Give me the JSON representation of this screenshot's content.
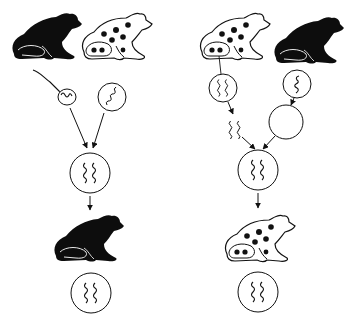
{
  "diagram": {
    "title": "Nuclear transplantation in frogs (reciprocal experiment)",
    "colors": {
      "ink": "#111111",
      "background": "#ffffff",
      "black_frog_fill": "#0d0d0d",
      "spotted_frog_fill": "#ffffff"
    },
    "panels": [
      {
        "id": "left",
        "donor_frogs": [
          "black-frog",
          "spotted-frog"
        ],
        "inputs": [
          "sperm-nucleus",
          "egg-nucleus"
        ],
        "zygote": "diploid-nucleus",
        "offspring": "black-frog",
        "offspring_nucleus": "diploid-nucleus"
      },
      {
        "id": "right",
        "donor_frogs": [
          "spotted-frog",
          "black-frog"
        ],
        "inputs": [
          "extracted-chromosomes",
          "enucleated-egg"
        ],
        "zygote": "diploid-nucleus",
        "offspring": "spotted-frog",
        "offspring_nucleus": "diploid-nucleus"
      }
    ]
  }
}
